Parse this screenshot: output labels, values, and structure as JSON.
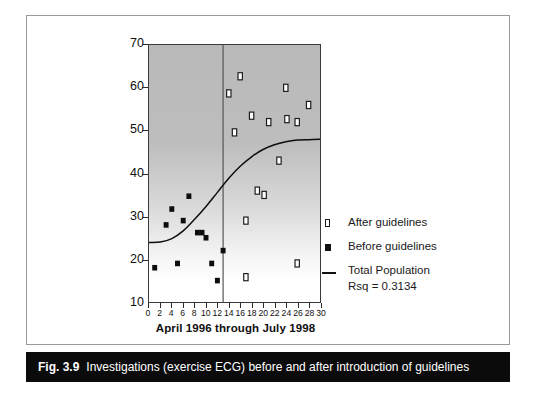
{
  "figure": {
    "caption_tag": "Fig. 3.9",
    "caption_text": "Investigations (exercise ECG) before and after introduction of guidelines"
  },
  "legend": {
    "items": [
      {
        "label": "After guidelines",
        "marker": "open-square-marker"
      },
      {
        "label": "Before guidelines",
        "marker": "filled-square-marker"
      },
      {
        "label": "Total Population",
        "sublabel": "Rsq = 0.3134",
        "marker": "line-marker"
      }
    ]
  },
  "chart_data": {
    "type": "scatter",
    "title": "",
    "xlabel": "April 1996 through July 1998",
    "ylabel": "Investigations: Exercise ECG",
    "xlim": [
      0,
      30
    ],
    "ylim": [
      10,
      70
    ],
    "xticks": [
      0,
      2,
      4,
      6,
      8,
      10,
      12,
      14,
      16,
      18,
      20,
      22,
      24,
      26,
      28,
      30
    ],
    "yticks": [
      10,
      20,
      30,
      40,
      50,
      60,
      70
    ],
    "grid": false,
    "legend_position": "right",
    "annotations": [
      {
        "type": "vertical-line",
        "x": 13,
        "label": "guidelines-introduction-divider"
      }
    ],
    "series": [
      {
        "name": "Before guidelines",
        "marker": "filled-square",
        "points": [
          [
            1,
            18
          ],
          [
            3,
            28
          ],
          [
            4,
            31.7
          ],
          [
            5,
            19
          ],
          [
            6,
            29
          ],
          [
            7,
            34.7
          ],
          [
            8.5,
            26.2
          ],
          [
            9.3,
            26.2
          ],
          [
            10,
            25
          ],
          [
            11,
            19
          ],
          [
            12,
            15
          ],
          [
            13,
            22
          ]
        ]
      },
      {
        "name": "After guidelines",
        "marker": "open-square",
        "points": [
          [
            14,
            58.7
          ],
          [
            16,
            62.7
          ],
          [
            15,
            49.6
          ],
          [
            17,
            29
          ],
          [
            18,
            53.5
          ],
          [
            19,
            36
          ],
          [
            20.2,
            35
          ],
          [
            21,
            52
          ],
          [
            22.8,
            43
          ],
          [
            24,
            60
          ],
          [
            24.2,
            52.7
          ],
          [
            26,
            52
          ],
          [
            26,
            19
          ],
          [
            28,
            56
          ],
          [
            17,
            15.8
          ]
        ]
      }
    ],
    "fit_curve": {
      "name": "Total Population",
      "rsq": 0.3134,
      "rsq_label": "Rsq = 0.3134",
      "points": [
        [
          0,
          23.9
        ],
        [
          2,
          24.0
        ],
        [
          4,
          24.8
        ],
        [
          6,
          26.6
        ],
        [
          8,
          29.3
        ],
        [
          10,
          32.3
        ],
        [
          12,
          35.6
        ],
        [
          14,
          38.9
        ],
        [
          16,
          41.7
        ],
        [
          18,
          43.9
        ],
        [
          20,
          45.6
        ],
        [
          22,
          46.7
        ],
        [
          24,
          47.4
        ],
        [
          26,
          47.8
        ],
        [
          28,
          47.9
        ],
        [
          30,
          48.0
        ]
      ]
    }
  }
}
